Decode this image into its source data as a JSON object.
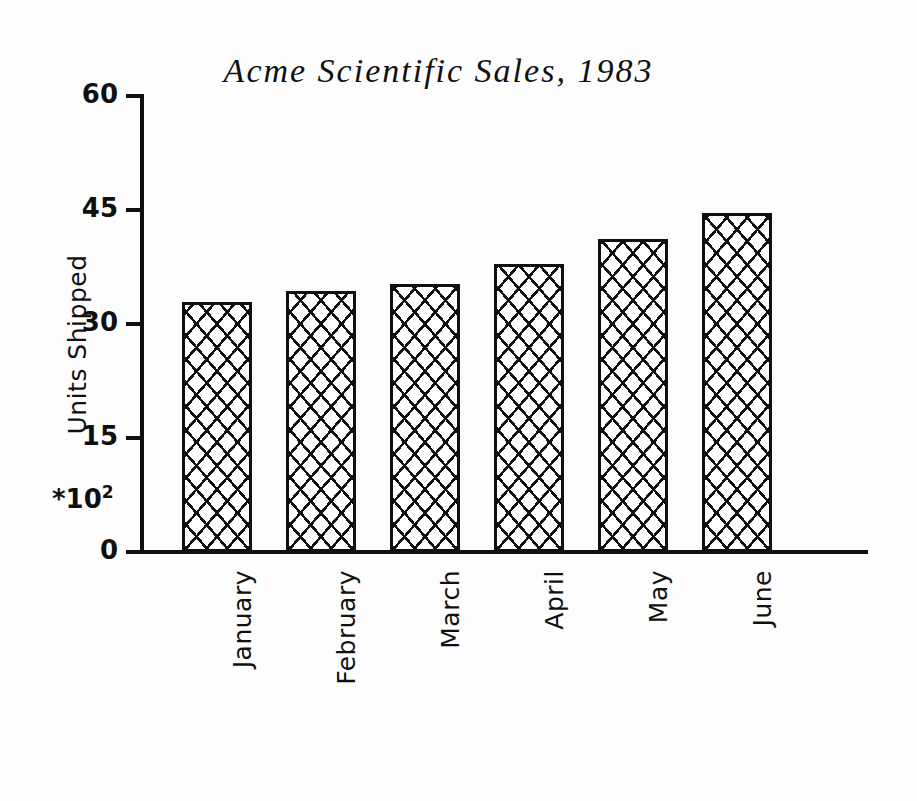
{
  "chart_data": {
    "type": "bar",
    "title": "Acme Scientific Sales, 1983",
    "xlabel": "",
    "ylabel": "Units Shipped",
    "y_multiplier": "*10",
    "y_multiplier_exponent": "2",
    "categories": [
      "January",
      "February",
      "March",
      "April",
      "May",
      "June"
    ],
    "values": [
      32.9,
      34.3,
      35.3,
      37.9,
      41.2,
      44.6
    ],
    "yticks": [
      "0",
      "15",
      "30",
      "45",
      "60"
    ],
    "ytick_values": [
      0,
      15,
      30,
      45,
      60
    ],
    "ylim": [
      0,
      60
    ],
    "grid": false,
    "legend": false,
    "bar_fill": "diagonal-crosshatch",
    "bar_color": "#101010",
    "background_color": "#ffffff"
  },
  "title": {
    "text": "Acme Scientific Sales, 1983"
  },
  "yaxis": {
    "caption": "Units Shipped",
    "multiplier_base": "*10",
    "multiplier_exp": "2",
    "ticks": [
      {
        "label": "60",
        "value": 60
      },
      {
        "label": "45",
        "value": 45
      },
      {
        "label": "30",
        "value": 30
      },
      {
        "label": "15",
        "value": 15
      },
      {
        "label": "0",
        "value": 0
      }
    ]
  },
  "xaxis": {
    "categories": [
      {
        "label": "January"
      },
      {
        "label": "February"
      },
      {
        "label": "March"
      },
      {
        "label": "April"
      },
      {
        "label": "May"
      },
      {
        "label": "June"
      }
    ]
  },
  "bars": [
    {
      "label": "January",
      "value": 32.9
    },
    {
      "label": "February",
      "value": 34.3
    },
    {
      "label": "March",
      "value": 35.3
    },
    {
      "label": "April",
      "value": 37.9
    },
    {
      "label": "May",
      "value": 41.2
    },
    {
      "label": "June",
      "value": 44.6
    }
  ]
}
